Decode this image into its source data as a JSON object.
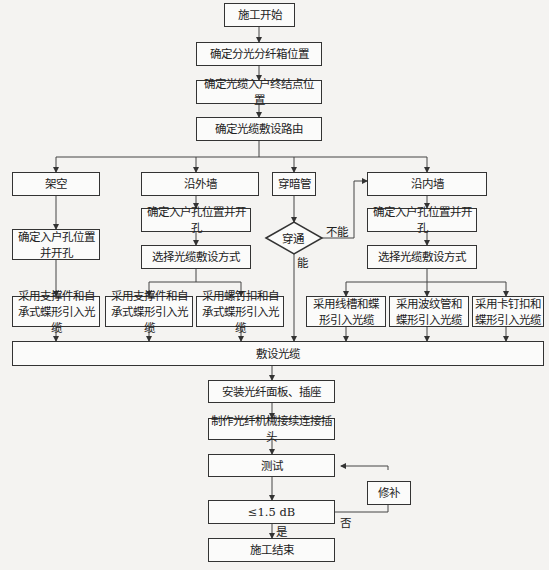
{
  "diagram": {
    "type": "flowchart",
    "nodes": {
      "start": "施工开始",
      "s1": "确定分光分纤箱位置",
      "s2": "确定光缆入户终结点位置",
      "s3": "确定光缆敷设路由",
      "b_aerial": "架空",
      "b_outer": "沿外墙",
      "b_conduit": "穿暗管",
      "b_inner": "沿内墙",
      "a1": "确定入户孔位置并开孔",
      "o1": "确定入户孔位置并开孔",
      "o2": "选择光缆敷设方式",
      "i1": "确定入户孔位置并开孔",
      "i2": "选择光缆敷设方式",
      "decision": "穿通",
      "m1": "采用支撑件和自承式蝶形引入光缆",
      "m2": "采用支撑件和自承式蝶形引入光缆",
      "m3": "采用螺钉扣和自承式蝶形引入光缆",
      "m4": "采用线槽和蝶形引入光缆",
      "m5": "采用波纹管和蝶形引入光缆",
      "m6": "采用卡钉扣和蝶形引入光缆",
      "lay": "敷设光缆",
      "f1": "安装光纤面板、插座",
      "f2": "制作光纤机械接续连接插头",
      "test": "测试",
      "repair": "修补",
      "check": "≤1.5 dB",
      "end": "施工结束"
    },
    "edge_labels": {
      "no_pass": "不能",
      "pass": "能",
      "yes": "是",
      "no": "否"
    }
  }
}
